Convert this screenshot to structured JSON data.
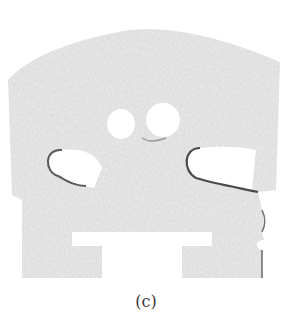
{
  "figure": {
    "caption": "(c)",
    "colors": {
      "background": "#ffffff",
      "wood": "#e9e9e9",
      "wood_grain": "#d4d4d4",
      "edge": "#5a5a5a"
    }
  }
}
